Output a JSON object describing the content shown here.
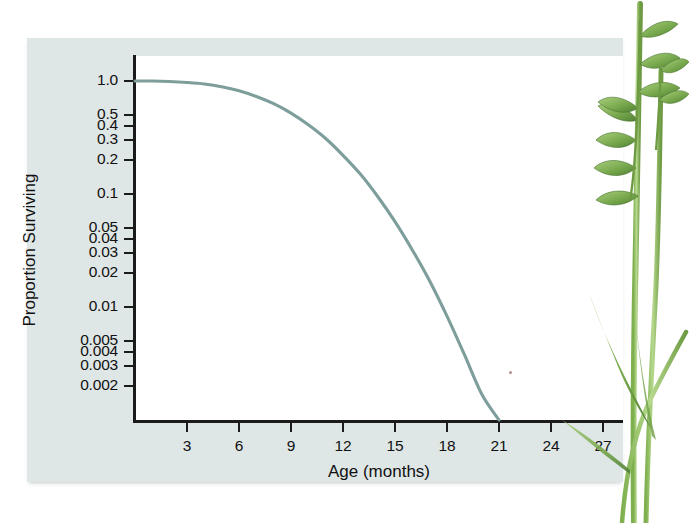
{
  "figure": {
    "background_color": "#dfe6e6",
    "plot_background_color": "#ffffff",
    "axis_color": "#1b1b1b",
    "curve_color": "#7d9e9b",
    "plant_green_dark": "#5f8f43",
    "plant_green_light": "#a8cc7e"
  },
  "chart_data": {
    "type": "line",
    "title": "",
    "xlabel": "Age (months)",
    "ylabel": "Proportion Surviving",
    "yscale": "log",
    "xlim": [
      0,
      28.5
    ],
    "ylim": [
      0.0017,
      1.0
    ],
    "grid": false,
    "legend": null,
    "x_ticks": [
      3,
      6,
      9,
      12,
      15,
      18,
      21,
      24,
      27
    ],
    "x_tick_labels": [
      "3",
      "6",
      "9",
      "12",
      "15",
      "18",
      "21",
      "24",
      "27"
    ],
    "y_ticks": [
      1.0,
      0.5,
      0.4,
      0.3,
      0.2,
      0.1,
      0.05,
      0.04,
      0.03,
      0.02,
      0.01,
      0.005,
      0.004,
      0.003,
      0.002
    ],
    "y_tick_labels": [
      "1.0",
      "0.5",
      "0.4",
      "0.3",
      "0.2",
      "0.1",
      "0.05",
      "0.04",
      "0.03",
      "0.02",
      "0.01",
      "0.005",
      "0.004",
      "0.003",
      "0.002"
    ],
    "series": [
      {
        "name": "Proportion surviving",
        "color": "#7d9e9b",
        "x": [
          0,
          1,
          2,
          3,
          4,
          5,
          6,
          7,
          8,
          9,
          10,
          11,
          12,
          13,
          14,
          15,
          16,
          17,
          18,
          19,
          20,
          21,
          22,
          23,
          24
        ],
        "y": [
          1.0,
          1.0,
          0.99,
          0.97,
          0.94,
          0.89,
          0.82,
          0.73,
          0.63,
          0.52,
          0.41,
          0.31,
          0.22,
          0.15,
          0.095,
          0.057,
          0.032,
          0.017,
          0.0083,
          0.0038,
          0.0017,
          0.00072,
          0.00028,
          0.0001,
          3e-05
        ]
      }
    ],
    "annotations": []
  },
  "illustration": {
    "name": "grass-plant",
    "description": "annual grass plant with seed heads and blade leaves"
  }
}
